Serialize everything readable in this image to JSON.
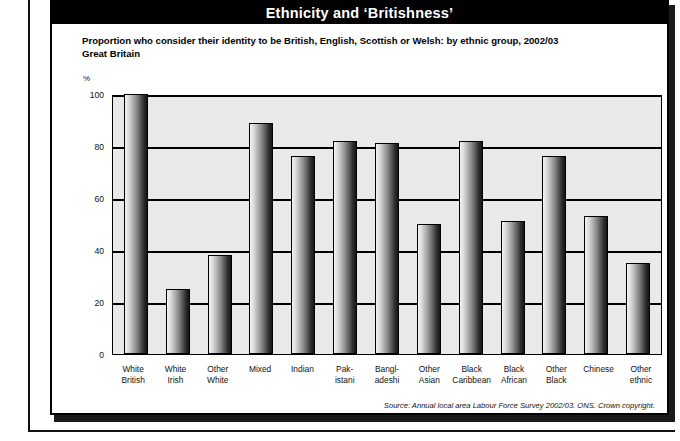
{
  "figure": {
    "title": "Ethnicity and ‘Britishness’",
    "subtitle_line1": "Proportion who consider their identity to be British, English, Scottish or Welsh: by ethnic group, 2002/03",
    "subtitle_line2": "Great Britain",
    "axis_unit": "%",
    "source": "Source: Annual local area Labour Force Survey 2002/03. ONS. Crown copyright."
  },
  "colors": {
    "title_bar_bg": "#000000",
    "title_text": "#ffffff",
    "plot_bg": "#e9e9e9",
    "gridline": "#000000",
    "bar_light": "#f2f2f2",
    "bar_dark": "#161616",
    "page_bg": "#ffffff"
  },
  "chart_data": {
    "type": "bar",
    "title": "Ethnicity and ‘Britishness’",
    "subtitle": "Proportion who consider their identity to be British, English, Scottish or Welsh: by ethnic group, 2002/03. Great Britain",
    "xlabel": "",
    "ylabel": "%",
    "ylim": [
      0,
      100
    ],
    "yticks": [
      0,
      20,
      40,
      60,
      80,
      100
    ],
    "grid": true,
    "legend": false,
    "categories": [
      "White British",
      "White Irish",
      "Other White",
      "Mixed",
      "Indian",
      "Pak- istani",
      "Bangl- adeshi",
      "Other Asian",
      "Black Caribbean",
      "Black African",
      "Other Black",
      "Chinese",
      "Other ethnic"
    ],
    "category_lines": [
      [
        "White",
        "British"
      ],
      [
        "White",
        "Irish"
      ],
      [
        "Other",
        "White"
      ],
      [
        "Mixed",
        ""
      ],
      [
        "Indian",
        ""
      ],
      [
        "Pak-",
        "istani"
      ],
      [
        "Bangl-",
        "adeshi"
      ],
      [
        "Other",
        "Asian"
      ],
      [
        "Black",
        "Caribbean"
      ],
      [
        "Black",
        "African"
      ],
      [
        "Other",
        "Black"
      ],
      [
        "Chinese",
        ""
      ],
      [
        "Other",
        "ethnic"
      ]
    ],
    "values": [
      100,
      25,
      38,
      89,
      76,
      82,
      81,
      50,
      82,
      51,
      76,
      53,
      35
    ],
    "source": "Source: Annual local area Labour Force Survey 2002/03. ONS. Crown copyright."
  }
}
